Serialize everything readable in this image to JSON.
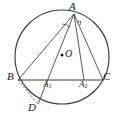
{
  "figure": {
    "kind": "geometry-diagram",
    "canvas": {
      "width": 117,
      "height": 120,
      "background": "#ffffff"
    },
    "stroke_color": "#3a3a3a",
    "label_color": "#1a1a1a",
    "circle": {
      "cx": 62,
      "cy": 57,
      "r": 47
    },
    "points": [
      {
        "id": "A",
        "label": "A",
        "sub": "",
        "x": 74,
        "y": 14,
        "label_x": 69,
        "label_y": 1
      },
      {
        "id": "B",
        "label": "B",
        "sub": "",
        "x": 18,
        "y": 80,
        "label_x": 7,
        "label_y": 71
      },
      {
        "id": "C",
        "label": "C",
        "sub": "",
        "x": 103,
        "y": 80,
        "label_x": 103,
        "label_y": 71
      },
      {
        "id": "D",
        "label": "D",
        "sub": "",
        "x": 38,
        "y": 104,
        "label_x": 28,
        "label_y": 102
      },
      {
        "id": "O",
        "label": "O",
        "sub": "",
        "x": 62,
        "y": 57,
        "label_x": 65,
        "label_y": 49
      },
      {
        "id": "A1",
        "label": "A",
        "sub": "1",
        "x": 48,
        "y": 80,
        "label_x": 43,
        "label_y": 80
      },
      {
        "id": "A2",
        "label": "A",
        "sub": "2",
        "x": 84,
        "y": 80,
        "label_x": 79,
        "label_y": 80
      }
    ],
    "segments": [
      {
        "id": "AB",
        "from": "A",
        "to": "B",
        "style": "solid"
      },
      {
        "id": "AC",
        "from": "A",
        "to": "C",
        "style": "solid"
      },
      {
        "id": "BC",
        "from": "B",
        "to": "C",
        "style": "solid"
      },
      {
        "id": "AD",
        "from": "A",
        "to": "D",
        "style": "solid"
      },
      {
        "id": "AA2",
        "from": "A",
        "to": "A2",
        "style": "solid"
      },
      {
        "id": "BD",
        "from": "B",
        "to": "D",
        "style": "dashed"
      }
    ],
    "marks": [
      {
        "id": "angle-arc-at-A",
        "type": "arc",
        "at": "A"
      },
      {
        "id": "right-angle-at-A2",
        "type": "right-angle",
        "at": "A2"
      },
      {
        "id": "center-dot",
        "type": "dot",
        "at": "O"
      }
    ]
  }
}
